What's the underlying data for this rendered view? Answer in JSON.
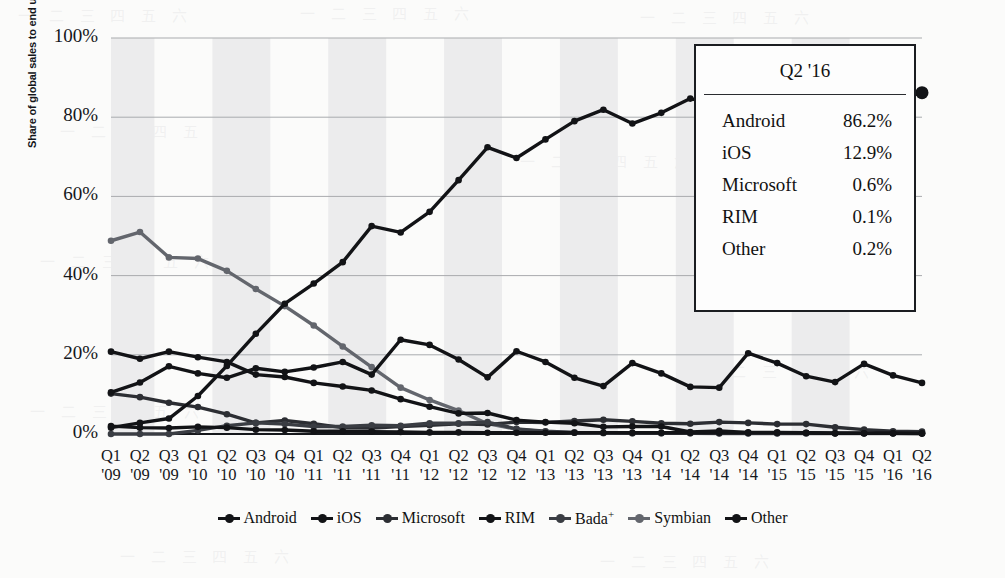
{
  "chart_data": {
    "type": "line",
    "title": "",
    "xlabel": "",
    "ylabel": "Share of global sales to end users",
    "ylim": [
      0,
      100
    ],
    "yticks": [
      "0%",
      "20%",
      "40%",
      "60%",
      "80%",
      "100%"
    ],
    "ytick_values": [
      0,
      20,
      40,
      60,
      80,
      100
    ],
    "grid": "horizontal",
    "legend_position": "bottom",
    "categories": [
      "Q1 '09",
      "Q2 '09",
      "Q3 '09",
      "Q1 '10",
      "Q2 '10",
      "Q3 '10",
      "Q4 '10",
      "Q1 '11",
      "Q2 '11",
      "Q3 '11",
      "Q4 '11",
      "Q1 '12",
      "Q2 '12",
      "Q3 '12",
      "Q4 '12",
      "Q1 '13",
      "Q2 '13",
      "Q3 '13",
      "Q4 '13",
      "Q1 '14",
      "Q2 '14",
      "Q3 '14",
      "Q4 '14",
      "Q1 '15",
      "Q2 '15",
      "Q3 '15",
      "Q4 '15",
      "Q1 '16",
      "Q2 '16"
    ],
    "category_lines": [
      [
        "Q1",
        "'09"
      ],
      [
        "Q2",
        "'09"
      ],
      [
        "Q3",
        "'09"
      ],
      [
        "Q1",
        "'10"
      ],
      [
        "Q2",
        "'10"
      ],
      [
        "Q3",
        "'10"
      ],
      [
        "Q4",
        "'10"
      ],
      [
        "Q1",
        "'11"
      ],
      [
        "Q2",
        "'11"
      ],
      [
        "Q3",
        "'11"
      ],
      [
        "Q4",
        "'11"
      ],
      [
        "Q1",
        "'12"
      ],
      [
        "Q2",
        "'12"
      ],
      [
        "Q3",
        "'12"
      ],
      [
        "Q4",
        "'12"
      ],
      [
        "Q1",
        "'13"
      ],
      [
        "Q2",
        "'13"
      ],
      [
        "Q3",
        "'13"
      ],
      [
        "Q4",
        "'13"
      ],
      [
        "Q1",
        "'14"
      ],
      [
        "Q2",
        "'14"
      ],
      [
        "Q3",
        "'14"
      ],
      [
        "Q4",
        "'14"
      ],
      [
        "Q1",
        "'15"
      ],
      [
        "Q2",
        "'15"
      ],
      [
        "Q3",
        "'15"
      ],
      [
        "Q4",
        "'15"
      ],
      [
        "Q1",
        "'16"
      ],
      [
        "Q2",
        "'16"
      ]
    ],
    "series": [
      {
        "name": "Android",
        "color": "#121316",
        "values": [
          1.6,
          2.8,
          3.9,
          9.6,
          17.2,
          25.3,
          32.9,
          38.0,
          43.4,
          52.5,
          50.9,
          56.1,
          64.1,
          72.4,
          69.7,
          74.4,
          79.0,
          81.9,
          78.4,
          81.1,
          84.7,
          83.1,
          76.0,
          78.8,
          82.2,
          84.7,
          80.7,
          84.1,
          86.2
        ]
      },
      {
        "name": "iOS",
        "color": "#121316",
        "values": [
          10.5,
          13.0,
          17.1,
          15.3,
          14.2,
          16.6,
          15.7,
          16.8,
          18.2,
          15.0,
          23.8,
          22.5,
          18.8,
          14.3,
          20.9,
          18.2,
          14.2,
          12.1,
          17.9,
          15.3,
          11.9,
          11.7,
          20.4,
          17.9,
          14.6,
          13.1,
          17.7,
          14.8,
          12.9
        ]
      },
      {
        "name": "Microsoft",
        "color": "#2c2e33",
        "values": [
          10.2,
          9.3,
          7.9,
          6.8,
          5.0,
          2.8,
          3.4,
          2.6,
          1.6,
          1.5,
          1.9,
          2.2,
          2.6,
          2.4,
          3.0,
          2.9,
          3.3,
          3.6,
          3.2,
          2.7,
          2.6,
          3.0,
          2.8,
          2.5,
          2.5,
          1.7,
          1.1,
          0.7,
          0.6
        ]
      },
      {
        "name": "RIM",
        "color": "#121316",
        "values": [
          20.8,
          19.0,
          20.8,
          19.4,
          18.2,
          15.0,
          14.4,
          12.9,
          12.0,
          11.0,
          8.8,
          6.9,
          5.2,
          5.3,
          3.5,
          3.0,
          2.7,
          1.8,
          1.9,
          1.9,
          0.5,
          0.8,
          0.4,
          0.4,
          0.3,
          0.2,
          0.2,
          0.2,
          0.1
        ]
      },
      {
        "name": "Bada⁺",
        "color": "#3a3d43",
        "values": [
          0.0,
          0.0,
          0.0,
          0.9,
          2.1,
          2.8,
          2.5,
          1.9,
          1.9,
          2.2,
          2.1,
          2.7,
          2.7,
          3.0,
          1.3,
          0.7,
          0.4,
          0.3,
          0.2,
          0.2,
          0.2,
          0.2,
          0.2,
          0.2,
          0.2,
          0.2,
          0.2,
          0.2,
          0.2
        ]
      },
      {
        "name": "Symbian",
        "color": "#63666d",
        "values": [
          48.8,
          51.0,
          44.6,
          44.3,
          41.2,
          36.6,
          32.3,
          27.4,
          22.1,
          16.9,
          11.7,
          8.6,
          5.9,
          2.6,
          1.2,
          0.6,
          0.3,
          0.2,
          0.2,
          0.2,
          0.2,
          0.1,
          0.1,
          0.1,
          0.1,
          0.1,
          0.1,
          0.1,
          0.1
        ]
      },
      {
        "name": "Other",
        "color": "#121316",
        "values": [
          2.0,
          1.6,
          1.5,
          1.8,
          1.6,
          1.1,
          1.0,
          0.7,
          0.7,
          0.6,
          0.5,
          0.4,
          0.4,
          0.3,
          0.3,
          0.3,
          0.3,
          0.3,
          0.3,
          0.3,
          0.3,
          0.3,
          0.3,
          0.3,
          0.3,
          0.2,
          0.2,
          0.2,
          0.2
        ]
      }
    ]
  },
  "callout": {
    "name": "Q2 '16 share table",
    "title": "Q2 '16",
    "rows": [
      {
        "label": "Android",
        "value": "86.2%"
      },
      {
        "label": "iOS",
        "value": "12.9%"
      },
      {
        "label": "Microsoft",
        "value": "0.6%"
      },
      {
        "label": "RIM",
        "value": "0.1%"
      },
      {
        "label": "Other",
        "value": "0.2%"
      }
    ]
  },
  "legend": {
    "items": [
      {
        "label": "Android",
        "color": "#121316"
      },
      {
        "label": "iOS",
        "color": "#121316"
      },
      {
        "label": "Microsoft",
        "color": "#2c2e33"
      },
      {
        "label": "RIM",
        "color": "#121316"
      },
      {
        "label": "Bada",
        "sup": "+",
        "color": "#3a3d43"
      },
      {
        "label": "Symbian",
        "color": "#63666d"
      },
      {
        "label": "Other",
        "color": "#121316"
      }
    ]
  },
  "colors": {
    "band": "#ececed",
    "gridline": "#a9abae",
    "axis": "#15171b",
    "paper": "#fbfbfa"
  }
}
